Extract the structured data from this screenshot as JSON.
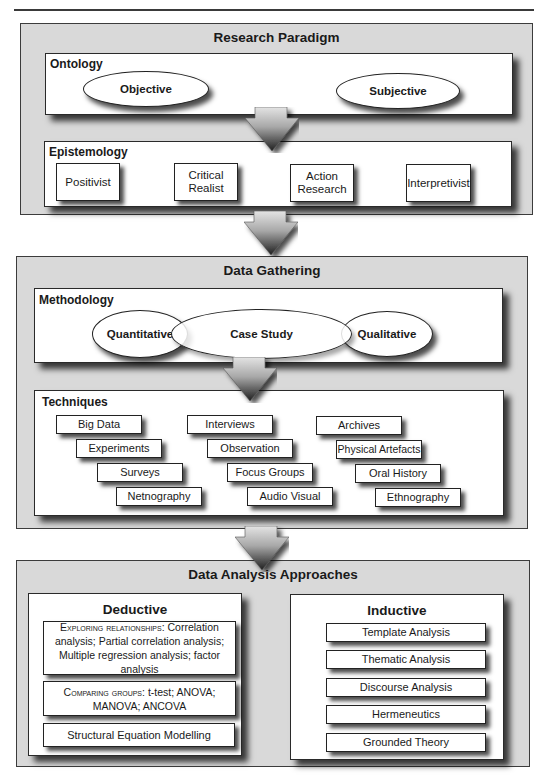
{
  "header": {
    "rule": true
  },
  "research_paradigm": {
    "title": "Research Paradigm",
    "ontology": {
      "title": "Ontology",
      "items": [
        "Objective",
        "Subjective"
      ]
    },
    "epistemology": {
      "title": "Epistemology",
      "items": [
        "Positivist",
        "Critical Realist",
        "Action Research",
        "Interpretivist"
      ]
    }
  },
  "data_gathering": {
    "title": "Data Gathering",
    "methodology": {
      "title": "Methodology",
      "items": [
        "Quantitative",
        "Case Study",
        "Qualitative"
      ]
    },
    "techniques": {
      "title": "Techniques",
      "columns": [
        [
          "Big Data",
          "Experiments",
          "Surveys",
          "Netnography"
        ],
        [
          "Interviews",
          "Observation",
          "Focus Groups",
          "Audio Visual"
        ],
        [
          "Archives",
          "Physical Artefacts",
          "Oral History",
          "Ethnography"
        ]
      ]
    }
  },
  "data_analysis": {
    "title": "Data Analysis Approaches",
    "deductive": {
      "title": "Deductive",
      "items": [
        {
          "lead": "Exploring relationships",
          "text": ": Correlation analysis; Partial correlation analysis; Multiple regression analysis; factor analysis"
        },
        {
          "lead": "Comparing groups",
          "text": ": t-test; ANOVA; MANOVA; ANCOVA"
        },
        {
          "lead": "",
          "text": "Structural Equation Modelling"
        }
      ]
    },
    "inductive": {
      "title": "Inductive",
      "items": [
        "Template Analysis",
        "Thematic Analysis",
        "Discourse Analysis",
        "Hermeneutics",
        "Grounded Theory"
      ]
    }
  },
  "colors": {
    "panel": "#d9d9d9",
    "box": "#ffffff",
    "border": "#2a2a2a"
  }
}
